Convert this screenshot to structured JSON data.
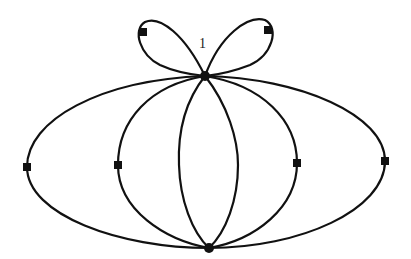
{
  "diagram": {
    "type": "multigraph",
    "vertices": [
      {
        "id": "top",
        "x": 205,
        "y": 76,
        "shape": "dot"
      },
      {
        "id": "bottom",
        "x": 209,
        "y": 248,
        "shape": "dot"
      }
    ],
    "edge_markers": [
      {
        "x": 27,
        "y": 167
      },
      {
        "x": 118,
        "y": 165
      },
      {
        "x": 297,
        "y": 163
      },
      {
        "x": 385,
        "y": 161
      },
      {
        "x": 143,
        "y": 32
      },
      {
        "x": 268,
        "y": 30
      }
    ],
    "loop_label": "1",
    "edges_between_vertices": 6,
    "loops_at_top": 2
  }
}
